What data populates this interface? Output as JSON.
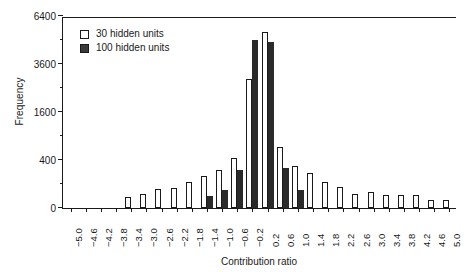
{
  "chart_data": {
    "type": "bar",
    "title": "",
    "xlabel": "Contribution ratio",
    "ylabel": "Frequency",
    "grid": false,
    "legend_position": "top-left",
    "y_scale": "sqrt",
    "ylim": [
      0,
      6400
    ],
    "y_ticks": [
      0,
      400,
      1600,
      3600,
      6400
    ],
    "y_tick_labels": [
      "0",
      "400",
      "1600",
      "3600",
      "6400"
    ],
    "y_minor_ticks": [
      100,
      900,
      2500,
      4900
    ],
    "categories": [
      "−5.0",
      "−4.6",
      "−4.2",
      "−3.8",
      "−3.4",
      "−3.0",
      "−2.6",
      "−2.2",
      "−1.8",
      "−1.4",
      "−1.0",
      "−0.6",
      "−0.2",
      "0.2",
      "0.6",
      "1.0",
      "1.4",
      "1.8",
      "2.2",
      "2.6",
      "3.0",
      "3.4",
      "3.8",
      "4.2",
      "4.6",
      "5.0"
    ],
    "series": [
      {
        "name": "30 hidden units",
        "color": "#ffffff",
        "edge_color": "#1a1a1a",
        "values": [
          0,
          0,
          0,
          0,
          20,
          35,
          60,
          70,
          120,
          175,
          255,
          440,
          2900,
          5400,
          650,
          310,
          210,
          120,
          80,
          35,
          45,
          30,
          30,
          30,
          12,
          10
        ]
      },
      {
        "name": "100 hidden units",
        "color": "#2a2a2a",
        "edge_color": "#2a2a2a",
        "values": [
          0,
          0,
          0,
          0,
          0,
          0,
          0,
          0,
          0,
          25,
          55,
          245,
          4900,
          4800,
          280,
          55,
          0,
          0,
          0,
          0,
          0,
          0,
          0,
          0,
          0,
          0
        ]
      }
    ]
  },
  "legend": {
    "items": [
      {
        "label": "30 hidden units",
        "swatch": "light"
      },
      {
        "label": "100 hidden units",
        "swatch": "dark"
      }
    ]
  }
}
